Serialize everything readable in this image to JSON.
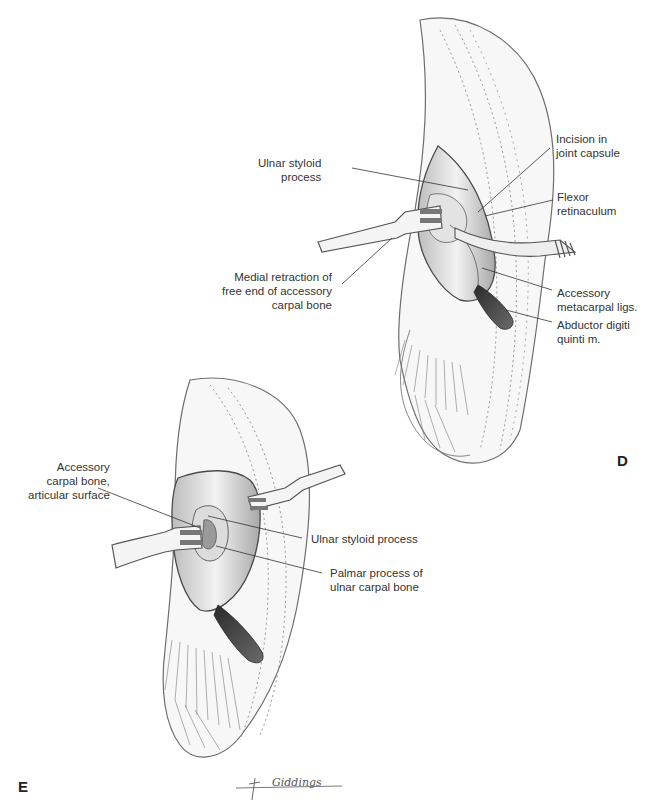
{
  "figure": {
    "panels": [
      {
        "id": "D",
        "letter": "D",
        "labels": [
          {
            "key": "ulnar_styloid",
            "lines": [
              "Ulnar styloid",
              "process"
            ],
            "align": "right"
          },
          {
            "key": "incision_joint_capsule",
            "lines": [
              "Incision in",
              "joint capsule"
            ],
            "align": "left"
          },
          {
            "key": "flexor_retinaculum",
            "lines": [
              "Flexor",
              "retinaculum"
            ],
            "align": "left"
          },
          {
            "key": "medial_retraction",
            "lines": [
              "Medial retraction of",
              "free end of accessory",
              "carpal bone"
            ],
            "align": "right"
          },
          {
            "key": "accessory_metacarpal_ligs",
            "lines": [
              "Accessory",
              "metacarpal ligs."
            ],
            "align": "left"
          },
          {
            "key": "abductor_digiti_quinti",
            "lines": [
              "Abductor digiti",
              "quinti m."
            ],
            "align": "left"
          }
        ]
      },
      {
        "id": "E",
        "letter": "E",
        "labels": [
          {
            "key": "accessory_carpal_articular",
            "lines": [
              "Accessory",
              "carpal bone,",
              "articular surface"
            ],
            "align": "right"
          },
          {
            "key": "ulnar_styloid_process",
            "lines": [
              "Ulnar styloid process"
            ],
            "align": "left"
          },
          {
            "key": "palmar_process",
            "lines": [
              "Palmar process of",
              "ulnar carpal bone"
            ],
            "align": "left"
          }
        ]
      }
    ],
    "signature": "Giddings",
    "colors": {
      "line": "#3a3a3a",
      "shade": "#8a8a8a",
      "tissue": "#d9d9d9",
      "background": "#ffffff"
    }
  }
}
